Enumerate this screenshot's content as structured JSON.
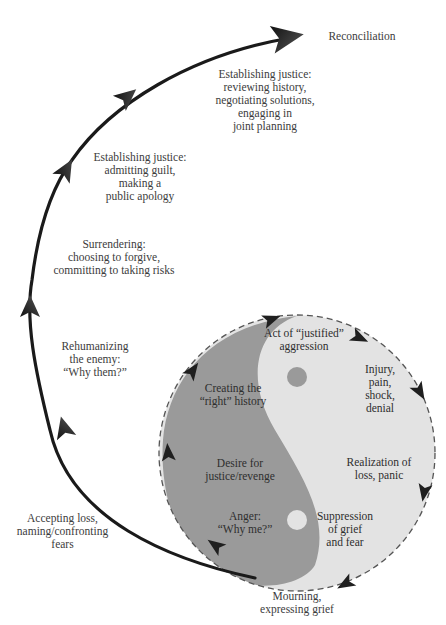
{
  "diagram": {
    "colors": {
      "background": "#ffffff",
      "arrow": "#1a1a1a",
      "circle_light": "#e3e3e3",
      "yin_dark": "#9a9a9a",
      "circle_border": "#555555",
      "text": "#3c3c3c"
    },
    "outer_path_labels": [
      {
        "id": "reconciliation",
        "text": "Reconciliation"
      },
      {
        "id": "justice-planning",
        "text": "Establishing justice:\nreviewing history,\nnegotiating solutions,\nengaging in\njoint planning"
      },
      {
        "id": "justice-apology",
        "text": "Establishing justice:\nadmitting guilt,\nmaking a\npublic apology"
      },
      {
        "id": "surrendering",
        "text": "Surrendering:\nchoosing to forgive,\ncommitting to taking risks"
      },
      {
        "id": "rehumanizing",
        "text": "Rehumanizing\nthe enemy:\n“Why them?”"
      },
      {
        "id": "accepting-loss",
        "text": "Accepting loss,\nnaming/confronting\nfears"
      },
      {
        "id": "mourning",
        "text": "Mourning,\nexpressing grief"
      }
    ],
    "cycle_labels": [
      {
        "id": "aggression",
        "text": "Act of “justified”\naggression"
      },
      {
        "id": "injury",
        "text": "Injury,\npain,\nshock,\ndenial"
      },
      {
        "id": "realization",
        "text": "Realization of\nloss, panic"
      },
      {
        "id": "suppression",
        "text": "Suppression\nof grief\nand fear"
      },
      {
        "id": "anger",
        "text": "Anger:\n“Why me?”"
      },
      {
        "id": "desire",
        "text": "Desire for\njustice/revenge"
      },
      {
        "id": "right-history",
        "text": "Creating the\n“right” history"
      }
    ]
  }
}
